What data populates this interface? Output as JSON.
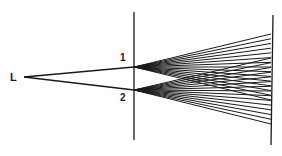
{
  "diagram": {
    "source": {
      "label": "L",
      "x": 24,
      "y": 77,
      "label_x": 10,
      "label_y": 81
    },
    "barrier": {
      "x": 134,
      "y1": 12,
      "y2": 140
    },
    "slits": [
      {
        "label": "1",
        "x": 134,
        "y": 67,
        "label_x": 120,
        "label_y": 61
      },
      {
        "label": "2",
        "x": 134,
        "y": 90,
        "label_x": 120,
        "label_y": 101
      }
    ],
    "screen": {
      "x1": 273,
      "y1": 15,
      "x2": 271,
      "y2": 145
    },
    "fans": [
      {
        "from_slit": 0,
        "screen_y_top": 34,
        "screen_y_bottom": 100,
        "rays": 15
      },
      {
        "from_slit": 1,
        "screen_y_top": 58,
        "screen_y_bottom": 124,
        "rays": 15
      }
    ],
    "colors": {
      "ink": "#1a1a1a",
      "background": "#ffffff"
    }
  }
}
